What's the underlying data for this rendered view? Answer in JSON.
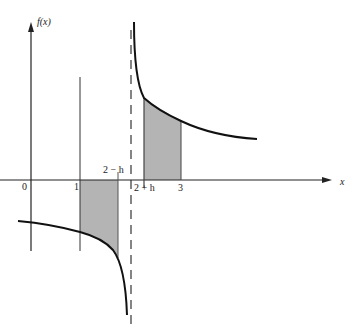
{
  "figure": {
    "y_axis_label": "f(x)",
    "x_axis_label": "x",
    "tick_labels": {
      "origin": "0",
      "one": "1",
      "two_minus_h": "2 − h",
      "two_plus_h": "2 + h",
      "three": "3"
    },
    "colors": {
      "line": "#111111",
      "shade": "#b4b4b4",
      "background": "#ffffff"
    }
  }
}
